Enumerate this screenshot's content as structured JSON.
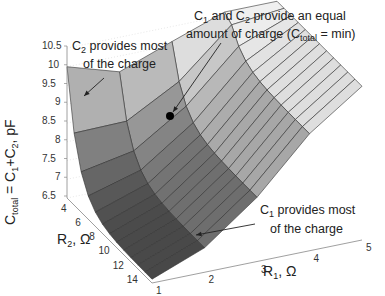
{
  "chart_data": {
    "type": "surface3d",
    "title": "",
    "zlabel": "C_total = C_1 + C_2, pF",
    "xlabel": "R_1, Ω",
    "ylabel": "R_2, Ω",
    "zlim": [
      6.5,
      10.5
    ],
    "z_ticks": [
      "10.5",
      "10",
      "9.5",
      "9",
      "8.5",
      "8",
      "7.5",
      "7",
      "6.5"
    ],
    "r1_ticks": [
      "1",
      "2",
      "3",
      "4",
      "5"
    ],
    "r2_ticks": [
      "4",
      "6",
      "8",
      "10",
      "12",
      "14"
    ],
    "grid": true,
    "colormap": "gray",
    "r1_values": [
      1,
      2,
      3,
      4,
      5
    ],
    "r2_values": [
      3,
      4,
      5,
      6,
      7,
      8,
      9,
      10,
      11,
      12,
      13,
      14,
      15
    ],
    "surface_note": "C_total has a minimum along the diagonal where C1 and C2 provide equal charge; increases toward low R2 (C2 dominant) and toward high R1 (C1 dominant).",
    "min_point": {
      "r1": 2,
      "r2": 3,
      "ctotal_approx": 8.95
    },
    "annotations": [
      {
        "id": "c2_most",
        "line1": "C2 provides most",
        "line2": "of the charge"
      },
      {
        "id": "equal",
        "line1": "C1 and C2 provide an equal",
        "line2": "amount of charge (C_total = min)"
      },
      {
        "id": "c1_most",
        "line1": "C1 provides most",
        "line2": "of the charge"
      }
    ]
  },
  "labels": {
    "z_axis": {
      "main": "C",
      "sub1": "total",
      "mid": " = C",
      "sub2": "1",
      "mid2": "+C",
      "sub3": "2",
      "tail": ", pF"
    },
    "r1_axis": {
      "main": "R",
      "sub": "1",
      "tail": ", Ω"
    },
    "r2_axis": {
      "main": "R",
      "sub": "2",
      "tail": ", Ω"
    },
    "ann_c2": {
      "c": "C",
      "sub": "2",
      "rest": " provides most",
      "line2": "of the charge"
    },
    "ann_eq": {
      "c1": "C",
      "sub1": "1",
      "and": " and C",
      "sub2": "2",
      "rest": " provide an equal",
      "line2a": "amount of charge (C",
      "line2sub": "total",
      "line2b": " = min)"
    },
    "ann_c1": {
      "c": "C",
      "sub": "1",
      "rest": " provides most",
      "line2": "of the charge"
    }
  }
}
